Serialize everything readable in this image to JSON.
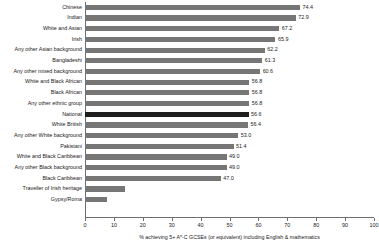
{
  "chart_data": {
    "type": "bar",
    "orientation": "horizontal",
    "title": "",
    "xlabel": "% achieving 5+ A*-C GCSEs (or equivalent) including English & mathematics",
    "ylabel": "",
    "xlim": [
      0,
      100
    ],
    "xticks": [
      0,
      10,
      20,
      30,
      40,
      50,
      60,
      70,
      80,
      90,
      100
    ],
    "grid": false,
    "legend": "none",
    "bar_color": "#767676",
    "highlight_color": "#1e1e1e",
    "highlight_category": "National",
    "categories": [
      "Chinese",
      "Indian",
      "White and Asian",
      "Irish",
      "Any other Asian background",
      "Bangladeshi",
      "Any other mixed background",
      "White and Black African",
      "Black African",
      "Any other ethnic group",
      "National",
      "White British",
      "Any other White background",
      "Pakistani",
      "White and Black Caribbean",
      "Any other Black background",
      "Black Caribbean",
      "Traveller of Irish heritage",
      "Gypsy/Roma"
    ],
    "values": [
      74.4,
      72.9,
      67.2,
      65.9,
      62.2,
      61.3,
      60.6,
      56.8,
      56.8,
      56.8,
      56.6,
      56.4,
      53.0,
      51.4,
      49.0,
      49.0,
      47.0,
      13.8,
      7.6
    ],
    "value_labels": [
      "74.4",
      "72.9",
      "67.2",
      "65.9",
      "62.2",
      "61.3",
      "60.6",
      "56.8",
      "56.8",
      "56.8",
      "56.6",
      "56.4",
      "53.0",
      "51.4",
      "49.0",
      "49.0",
      "47.0",
      "",
      ""
    ]
  }
}
